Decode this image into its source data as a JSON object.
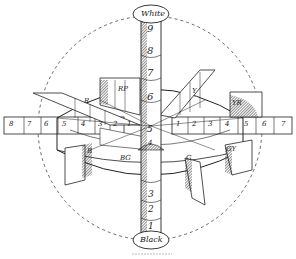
{
  "diagram": {
    "axis": {
      "top_label": "White",
      "bottom_label": "Black",
      "upper_numbers": [
        "9",
        "8",
        "7",
        "6",
        "5"
      ],
      "lower_numbers": [
        "4",
        "3",
        "2",
        "1"
      ]
    },
    "left_scale": [
      "8",
      "7",
      "6",
      "5",
      "4",
      "3",
      "2",
      "1"
    ],
    "right_scale": [
      "1",
      "2",
      "3",
      "4",
      "5",
      "6",
      "7"
    ],
    "hue_labels": {
      "rp": "RP",
      "r": "R",
      "y": "Y",
      "yr": "YR",
      "b": "B",
      "bg": "BG",
      "g": "G",
      "gy": "GY"
    },
    "caption": "Fig. illegible caption"
  }
}
